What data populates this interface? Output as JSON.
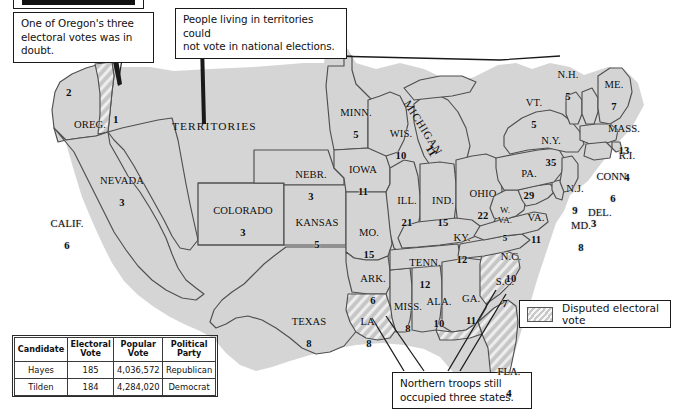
{
  "figure": {
    "type": "electoral-map",
    "region": "United States",
    "election": "1876"
  },
  "callouts": [
    {
      "id": "oregon",
      "text": "One of Oregon's three\nelectoral votes was in doubt."
    },
    {
      "id": "territories",
      "text": "People living in territories could\nnot vote in national elections."
    },
    {
      "id": "troops",
      "text": "Northern troops still\noccupied three states."
    }
  ],
  "territories_label": "TERRITORIES",
  "legend": {
    "swatch_label": "Disputed electoral vote",
    "swatch_color": "#c9c9c9"
  },
  "results_table": {
    "headers": [
      "Candidate",
      "Electoral\nVote",
      "Popular\nVote",
      "Political\nParty"
    ],
    "header_candidate": "Candidate",
    "header_electoral": "Electoral Vote",
    "header_popular": "Popular Vote",
    "header_party": "Political Party",
    "rows": [
      {
        "candidate": "Hayes",
        "electoral_vote": "185",
        "popular_vote": "4,036,572",
        "party": "Republican"
      },
      {
        "candidate": "Tilden",
        "electoral_vote": "184",
        "popular_vote": "4,284,020",
        "party": "Democrat"
      }
    ]
  },
  "states": [
    {
      "id": "oregon",
      "name": "OREG.",
      "ev_undisputed": "2",
      "ev_disputed": "1",
      "disputed": "partial"
    },
    {
      "id": "calif",
      "name": "CALIF.",
      "ev": "6",
      "disputed": false
    },
    {
      "id": "nevada",
      "name": "NEVADA",
      "ev": "3",
      "disputed": false
    },
    {
      "id": "colorado",
      "name": "COLORADO",
      "ev": "3",
      "disputed": false
    },
    {
      "id": "nebr",
      "name": "NEBR.",
      "ev": "3",
      "disputed": false
    },
    {
      "id": "kansas",
      "name": "KANSAS",
      "ev": "5",
      "disputed": false
    },
    {
      "id": "texas",
      "name": "TEXAS",
      "ev": "8",
      "disputed": false
    },
    {
      "id": "minn",
      "name": "MINN.",
      "ev": "5",
      "disputed": false
    },
    {
      "id": "wis",
      "name": "WIS.",
      "ev": "10",
      "disputed": false
    },
    {
      "id": "iowa",
      "name": "IOWA",
      "ev": "11",
      "disputed": false
    },
    {
      "id": "michigan",
      "name": "MICHIGAN",
      "ev": "11",
      "disputed": false
    },
    {
      "id": "mo",
      "name": "MO.",
      "ev": "15",
      "disputed": false
    },
    {
      "id": "ill",
      "name": "ILL.",
      "ev": "21",
      "disputed": false
    },
    {
      "id": "ind",
      "name": "IND.",
      "ev": "15",
      "disputed": false
    },
    {
      "id": "ohio",
      "name": "OHIO",
      "ev": "22",
      "disputed": false
    },
    {
      "id": "ark",
      "name": "ARK.",
      "ev": "6",
      "disputed": false
    },
    {
      "id": "la",
      "name": "LA.",
      "ev": "8",
      "disputed": true
    },
    {
      "id": "miss",
      "name": "MISS.",
      "ev": "8",
      "disputed": false
    },
    {
      "id": "ala",
      "name": "ALA.",
      "ev": "10",
      "disputed": false
    },
    {
      "id": "tenn",
      "name": "TENN.",
      "ev": "12",
      "disputed": false
    },
    {
      "id": "ky",
      "name": "KY.",
      "ev": "12",
      "disputed": false
    },
    {
      "id": "ga",
      "name": "GA.",
      "ev": "11",
      "disputed": false
    },
    {
      "id": "fla",
      "name": "FLA.",
      "ev": "4",
      "disputed": true
    },
    {
      "id": "sc",
      "name": "S.C.",
      "ev": "7",
      "disputed": true
    },
    {
      "id": "nc",
      "name": "N.C.",
      "ev": "10",
      "disputed": false
    },
    {
      "id": "wva",
      "name": "W. VA.",
      "ev": "5",
      "disputed": false
    },
    {
      "id": "va",
      "name": "VA.",
      "ev": "11",
      "disputed": false
    },
    {
      "id": "md",
      "name": "MD.",
      "ev": "8",
      "disputed": false
    },
    {
      "id": "del",
      "name": "DEL.",
      "ev": "3",
      "disputed": false
    },
    {
      "id": "pa",
      "name": "PA.",
      "ev": "29",
      "disputed": false
    },
    {
      "id": "nj",
      "name": "N.J.",
      "ev": "9",
      "disputed": false
    },
    {
      "id": "ny",
      "name": "N.Y.",
      "ev": "35",
      "disputed": false
    },
    {
      "id": "conn",
      "name": "CONN.",
      "ev": "6",
      "disputed": false
    },
    {
      "id": "ri",
      "name": "R.I.",
      "ev": "4",
      "disputed": false
    },
    {
      "id": "mass",
      "name": "MASS.",
      "ev": "13",
      "disputed": false
    },
    {
      "id": "vt",
      "name": "VT.",
      "ev": "5",
      "disputed": false
    },
    {
      "id": "nh",
      "name": "N.H.",
      "ev": "5",
      "disputed": false
    },
    {
      "id": "me",
      "name": "ME.",
      "ev": "7",
      "disputed": false
    }
  ],
  "colors": {
    "state_fill": "#d4d4d4",
    "state_stroke": "#4a4a4a",
    "coast_shadow": "#9a9a9a",
    "text": "#0d0d0d",
    "box_border": "#1a1a1a",
    "background": "#ffffff"
  }
}
